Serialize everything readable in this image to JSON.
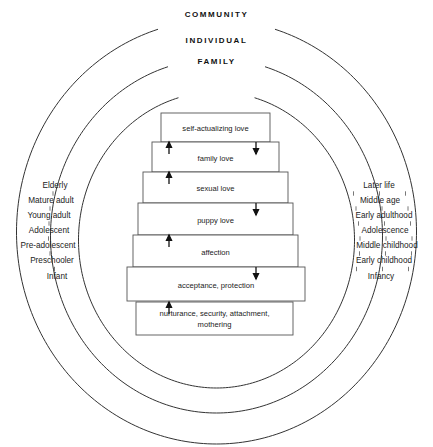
{
  "rings": [
    {
      "label": "COMMUNITY",
      "cx": 216.5,
      "cy": 232,
      "rx": 200,
      "ry": 212,
      "gap_deg": 17,
      "label_x": 216.5,
      "label_y": 10
    },
    {
      "label": "INDIVIDUAL",
      "cx": 216.5,
      "cy": 236,
      "rx": 166,
      "ry": 177,
      "gap_deg": 17,
      "label_x": 216.5,
      "label_y": 36
    },
    {
      "label": "FAMILY",
      "cx": 216.5,
      "cy": 240,
      "rx": 138,
      "ry": 148,
      "gap_deg": 16,
      "label_x": 216.5,
      "label_y": 57
    }
  ],
  "pyramid": {
    "boxes": [
      {
        "text": "self-actualizing love",
        "x": 161,
        "y": 113,
        "w": 109,
        "h": 29
      },
      {
        "text": "family love",
        "x": 152,
        "y": 142,
        "w": 127,
        "h": 30
      },
      {
        "text": "sexual love",
        "x": 143,
        "y": 172,
        "w": 145,
        "h": 31
      },
      {
        "text": "puppy love",
        "x": 138,
        "y": 203,
        "w": 155,
        "h": 32
      },
      {
        "text": "affection",
        "x": 133,
        "y": 235,
        "w": 165,
        "h": 32
      },
      {
        "text": "acceptance, protection",
        "x": 127,
        "y": 267,
        "w": 178,
        "h": 34
      },
      {
        "text": "nurturance, security, attachment,\nmothering",
        "x": 136,
        "y": 302,
        "w": 157,
        "h": 33
      }
    ],
    "arrows_up": [
      {
        "x": 169,
        "y_top": 142,
        "y_bottom": 154
      },
      {
        "x": 169,
        "y_top": 172,
        "y_bottom": 184
      },
      {
        "x": 169,
        "y_top": 235,
        "y_bottom": 247
      },
      {
        "x": 169,
        "y_top": 302,
        "y_bottom": 314
      }
    ],
    "arrows_down": [
      {
        "x": 256,
        "y_top": 142,
        "y_bottom": 154
      },
      {
        "x": 256,
        "y_top": 203,
        "y_bottom": 215
      },
      {
        "x": 256,
        "y_top": 267,
        "y_bottom": 279
      }
    ]
  },
  "stages_left": [
    {
      "label": "Elderly",
      "x": 55,
      "y": 186
    },
    {
      "label": "Mature adult",
      "x": 51,
      "y": 201
    },
    {
      "label": "Young adult",
      "x": 49,
      "y": 216
    },
    {
      "label": "Adolescent",
      "x": 49,
      "y": 231
    },
    {
      "label": "Pre-adolescent",
      "x": 48,
      "y": 246
    },
    {
      "label": "Preschooler",
      "x": 52,
      "y": 261
    },
    {
      "label": "Infant",
      "x": 57,
      "y": 277
    }
  ],
  "stages_right": [
    {
      "label": "Later life",
      "x": 379,
      "y": 186
    },
    {
      "label": "Middle age",
      "x": 380,
      "y": 201
    },
    {
      "label": "Early adulthood",
      "x": 384,
      "y": 216
    },
    {
      "label": "Adolescence",
      "x": 385,
      "y": 231
    },
    {
      "label": "Middle childhood",
      "x": 387,
      "y": 246
    },
    {
      "label": "Early childhood",
      "x": 384,
      "y": 261
    },
    {
      "label": "Infancy",
      "x": 381,
      "y": 277
    }
  ],
  "colors": {
    "stroke": "#333333",
    "box_stroke": "#555555",
    "text": "#222222",
    "background": "#ffffff"
  }
}
